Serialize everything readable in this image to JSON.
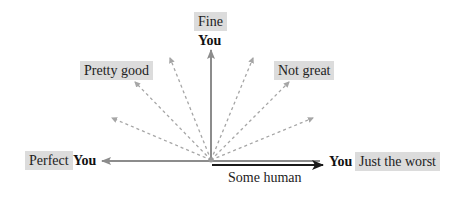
{
  "diagram": {
    "labels": {
      "fine": "Fine",
      "pretty_good": "Pretty good",
      "not_great": "Not great",
      "perfect": "Perfect",
      "just_the_worst": "Just the worst"
    },
    "you_label": "You",
    "baseline_label": "Some human",
    "colors": {
      "label_bg": "#dcdcdc",
      "gray_arrow": "#8c8c8c",
      "dashed_ray": "#a6a6a6",
      "black_arrow": "#1a1a1a"
    }
  }
}
